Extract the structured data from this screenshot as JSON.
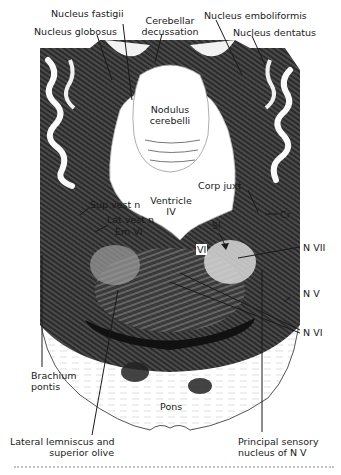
{
  "figure": {
    "labels": {
      "nucleus_fastigii": "Nucleus fastigii",
      "nucleus_globosus": "Nucleus globosus",
      "cerebellar_decussation_1": "Cerebellar",
      "cerebellar_decussation_2": "decussation",
      "nucleus_emboliformis": "Nucleus emboliformis",
      "nucleus_dentatus": "Nucleus dentatus",
      "nodulus_1": "Nodulus",
      "nodulus_2": "cerebelli",
      "corp_juxt": "Corp juxt",
      "cr": "Cr",
      "ventricle_1": "Ventricle",
      "ventricle_2": "IV",
      "sup_vest": "Sup vest n",
      "lat_vest": "Lat vest n",
      "em_vi": "Em VI",
      "sl": "Sl",
      "vi": "VI",
      "n_vii": "N VII",
      "n_v": "N V",
      "n_vi": "N VI",
      "brachium_1": "Brachium",
      "brachium_2": "pontis",
      "pons": "Pons",
      "lat_lemn_1": "Lateral lemniscus and",
      "lat_lemn_2": "superior olive",
      "princ_sens_1": "Principal sensory",
      "princ_sens_2": "nucleus of N V"
    },
    "colors": {
      "ink": "#1a1a1a",
      "tissue_dark": "#222222",
      "tissue_mid": "#6b6b6b",
      "background": "#ffffff"
    }
  }
}
